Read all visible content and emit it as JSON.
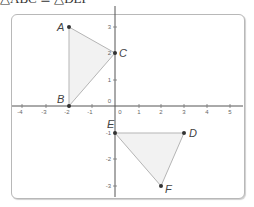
{
  "header": {
    "text": "△ABC ≅ △DEF"
  },
  "graph": {
    "x_axis": {
      "min": -4,
      "max": 5,
      "ticks": [
        "-4",
        "-3",
        "-2",
        "-1",
        "0",
        "1",
        "2",
        "3",
        "4",
        "5"
      ]
    },
    "y_axis": {
      "min": -3,
      "max": 3,
      "ticks": [
        "3",
        "2",
        "1",
        "0",
        "-1",
        "-2",
        "-3"
      ]
    },
    "colors": {
      "axis": "#555555",
      "edge": "#b0b0b0",
      "fill": "#f1f1f1",
      "point": "#333333"
    },
    "triangles": [
      {
        "name": "ABC",
        "points": [
          {
            "label": "A",
            "x": -2,
            "y": 3
          },
          {
            "label": "B",
            "x": -2,
            "y": 0
          },
          {
            "label": "C",
            "x": 0,
            "y": 2
          }
        ]
      },
      {
        "name": "DEF",
        "points": [
          {
            "label": "D",
            "x": 3,
            "y": -1
          },
          {
            "label": "E",
            "x": 0,
            "y": -1
          },
          {
            "label": "F",
            "x": 2,
            "y": -3
          }
        ]
      }
    ]
  }
}
